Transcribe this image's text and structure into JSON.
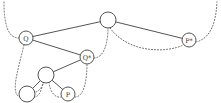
{
  "diagram": {
    "type": "tree-with-threading",
    "nodes": [
      {
        "id": "root",
        "label": "",
        "x": 108,
        "y": 20,
        "r": 8
      },
      {
        "id": "q",
        "label": "Q",
        "x": 26,
        "y": 38,
        "r": 7
      },
      {
        "id": "qstar",
        "label": "Q*",
        "x": 87,
        "y": 57,
        "r": 7
      },
      {
        "id": "inner",
        "label": "",
        "x": 46,
        "y": 75,
        "r": 8
      },
      {
        "id": "leaf-left",
        "label": "",
        "x": 27,
        "y": 94,
        "r": 8
      },
      {
        "id": "p",
        "label": "P",
        "x": 68,
        "y": 94,
        "r": 7
      },
      {
        "id": "pstar",
        "label": "P*",
        "x": 189,
        "y": 40,
        "r": 7
      }
    ],
    "solid_edges": [
      {
        "from": "root",
        "to": "q"
      },
      {
        "from": "root",
        "to": "pstar"
      },
      {
        "from": "q",
        "to": "qstar"
      },
      {
        "from": "qstar",
        "to": "inner"
      },
      {
        "from": "inner",
        "to": "leaf-left"
      },
      {
        "from": "inner",
        "to": "p"
      }
    ],
    "dotted_paths": [
      {
        "id": "thread-top-left-to-q",
        "d": "M 4 2 C 4 25, 8 38, 19 38"
      },
      {
        "id": "thread-q-to-leafleft",
        "d": "M 24 45 C 18 70, 10 94, 20 97"
      },
      {
        "id": "thread-leafleft-to-inner",
        "d": "M 34 97 C 40 97, 42 88, 43 82"
      },
      {
        "id": "thread-inner-to-p",
        "d": "M 49 82 C 50 92, 55 98, 61 97"
      },
      {
        "id": "thread-p-to-qstar",
        "d": "M 75 97 C 84 97, 87 80, 87 64"
      },
      {
        "id": "thread-qstar-to-root",
        "d": "M 94 58 C 105 58, 108 40, 108 28"
      },
      {
        "id": "thread-root-to-pstar",
        "d": "M 110 28 C 130 55, 170 52, 183 45"
      },
      {
        "id": "thread-pstar-to-topright",
        "d": "M 196 42 C 212 38, 216 20, 217 2"
      },
      {
        "id": "thread-inner-mid",
        "d": "M 44 82 C 42 88, 38 92, 35 92"
      }
    ]
  }
}
